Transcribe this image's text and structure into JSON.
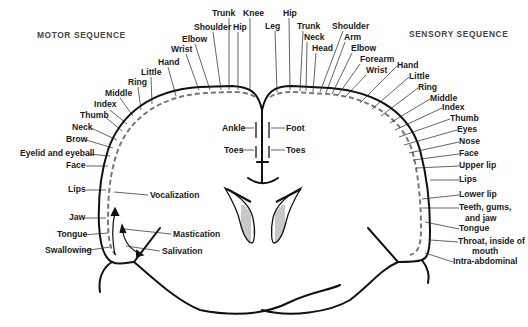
{
  "titles": {
    "motor": "MOTOR SEQUENCE",
    "sensory": "SENSORY SEQUENCE"
  },
  "motor": {
    "top": [
      "Trunk",
      "Knee",
      "Hip",
      "Shoulder",
      "Elbow",
      "Wrist",
      "Hand",
      "Little",
      "Ring",
      "Middle",
      "Index"
    ],
    "side": [
      "Thumb",
      "Neck",
      "Brow",
      "Eyelid and eyeball",
      "Face",
      "Lips",
      "Jaw",
      "Tongue",
      "Swallowing"
    ],
    "inner": [
      "Ankle",
      "Toes"
    ],
    "functions": [
      "Vocalization",
      "Mastication",
      "Salivation"
    ]
  },
  "sensory": {
    "top": [
      "Hip",
      "Leg",
      "Trunk",
      "Neck",
      "Head",
      "Shoulder",
      "Arm",
      "Elbow",
      "Forearm",
      "Wrist",
      "Hand",
      "Little",
      "Ring",
      "Middle",
      "Index"
    ],
    "side": [
      "Thumb",
      "Eyes",
      "Nose",
      "Face",
      "Upper lip",
      "Lips",
      "Lower lip",
      "Teeth, gums,",
      "and jaw",
      "Tongue",
      "Throat, inside of",
      "mouth",
      "Intra-abdominal"
    ],
    "inner": [
      "Foot",
      "Toes"
    ]
  }
}
